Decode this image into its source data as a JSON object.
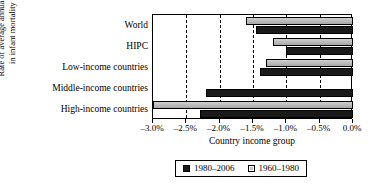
{
  "chart_data": {
    "type": "bar",
    "orientation": "horizontal",
    "title": "",
    "xlabel": "Country income group",
    "ylabel": "Rate of average annual decline in infant mortality rates",
    "ylabel_lines": [
      "Rate of average annual decline",
      "in infant mortality rates"
    ],
    "categories": [
      "World",
      "HIPC",
      "Low-income countries",
      "Middle-income countries",
      "High-income countries"
    ],
    "xlim": [
      -3.0,
      0.0
    ],
    "xticks": [
      -3.0,
      -2.5,
      -2.0,
      -1.5,
      -1.0,
      -0.5,
      0.0
    ],
    "xticklabels": [
      "–3.0%",
      "–2.5%",
      "–2.0%",
      "–1.5%",
      "–1.0%",
      "–0.5%",
      "0.0%"
    ],
    "grid": "vertical-dashed",
    "legend_position": "bottom-center",
    "series": [
      {
        "name": "1980–2006",
        "color": "#1a1a1a",
        "style": "dark",
        "values": [
          -1.45,
          -1.0,
          -1.4,
          -2.2,
          -2.3
        ]
      },
      {
        "name": "1960–1980",
        "color": "#c2c2c2",
        "style": "light",
        "values": [
          -1.6,
          -1.2,
          -1.3,
          0.0,
          -3.0
        ]
      }
    ]
  },
  "legend": {
    "entries": [
      {
        "label": "1980–2006",
        "swatch": "dark"
      },
      {
        "label": "1960–1980",
        "swatch": "light"
      }
    ]
  }
}
